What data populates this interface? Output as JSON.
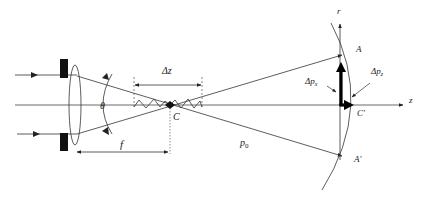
{
  "diagram": {
    "title": "",
    "labels": {
      "delta_z": "Δz",
      "theta": "θ",
      "focus": "C",
      "focal_length": "f",
      "p0": "p",
      "p0_sub": "0",
      "point_a": "A",
      "point_a_prime": "A'",
      "point_c_prime": "C'",
      "delta_px": "Δp",
      "delta_px_sub": "x",
      "delta_pz": "Δp",
      "delta_pz_sub": "z",
      "axis_r": "r",
      "axis_z": "z"
    },
    "elements": [
      "aperture-stop-top",
      "aperture-stop-bottom",
      "lens",
      "incoming-ray-top",
      "incoming-ray-bottom",
      "optical-axis",
      "converging-ray-upper",
      "converging-ray-lower",
      "focal-zone-zigzag",
      "sphere-arc",
      "momentum-vector-x",
      "momentum-vector-z"
    ],
    "colors": {
      "line": "#333333",
      "thick": "#000000",
      "background": "#ffffff"
    }
  }
}
